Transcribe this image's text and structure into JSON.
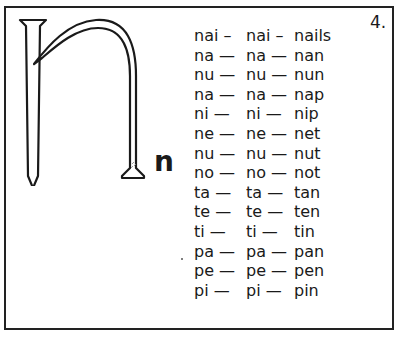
{
  "page": {
    "number": "4.",
    "letter": "n",
    "illustration": "nail shaped like letter n"
  },
  "rows": [
    {
      "a": "nai –",
      "b": "nai –",
      "word": "nails"
    },
    {
      "a": "na —",
      "b": "na —",
      "word": "nan"
    },
    {
      "a": "nu —",
      "b": "nu —",
      "word": "nun"
    },
    {
      "a": "na —",
      "b": "na —",
      "word": "nap"
    },
    {
      "a": "ni —",
      "b": "ni —",
      "word": "nip"
    },
    {
      "a": "ne —",
      "b": "ne —",
      "word": "net"
    },
    {
      "a": "nu —",
      "b": "nu —",
      "word": "nut"
    },
    {
      "a": "no —",
      "b": "no —",
      "word": "not"
    },
    {
      "a": "ta —",
      "b": "ta —",
      "word": "tan"
    },
    {
      "a": "te —",
      "b": "te —",
      "word": "ten"
    },
    {
      "a": "ti —",
      "b": "ti —",
      "word": "tin"
    },
    {
      "a": "pa —",
      "b": "pa —",
      "word": "pan"
    },
    {
      "a": "pe —",
      "b": "pe —",
      "word": "pen"
    },
    {
      "a": "pi —",
      "b": "pi —",
      "word": "pin"
    }
  ]
}
